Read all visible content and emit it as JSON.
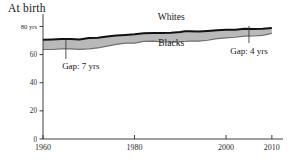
{
  "chart_data": {
    "type": "area",
    "title": "At birth",
    "xlabel": "",
    "ylabel": "",
    "ylim": [
      0,
      86
    ],
    "xlim": [
      1960,
      2012
    ],
    "grid": false,
    "legend_position": "inline-annotations",
    "y_ticks": [
      0,
      20,
      40,
      60,
      80
    ],
    "y_tick_labels": [
      "0",
      "20",
      "40",
      "60",
      "80 yrs"
    ],
    "x_ticks": [
      1960,
      1980,
      2000,
      2010
    ],
    "x_tick_labels": [
      "1960",
      "1980",
      "2000",
      "2010"
    ],
    "series": [
      {
        "name": "Whites",
        "color": "#111111",
        "x": [
          1960,
          1962,
          1964,
          1966,
          1968,
          1970,
          1972,
          1974,
          1976,
          1978,
          1980,
          1982,
          1984,
          1986,
          1988,
          1990,
          1991,
          1992,
          1994,
          1996,
          1998,
          2000,
          2002,
          2004,
          2006,
          2008,
          2010
        ],
        "values": [
          70.6,
          70.8,
          71.0,
          71.0,
          70.8,
          71.7,
          72.0,
          72.8,
          73.5,
          74.0,
          74.4,
          75.1,
          75.3,
          75.4,
          75.6,
          76.1,
          76.6,
          76.5,
          76.4,
          76.8,
          77.3,
          77.6,
          77.7,
          78.3,
          78.2,
          78.4,
          78.9
        ]
      },
      {
        "name": "Blacks",
        "color": "#6f6f6f",
        "x": [
          1960,
          1962,
          1964,
          1966,
          1968,
          1970,
          1972,
          1974,
          1976,
          1978,
          1980,
          1982,
          1984,
          1986,
          1988,
          1990,
          1991,
          1992,
          1994,
          1996,
          1998,
          2000,
          2002,
          2004,
          2006,
          2008,
          2010
        ],
        "values": [
          63.6,
          63.6,
          64.1,
          64.0,
          63.7,
          64.1,
          64.7,
          66.0,
          67.2,
          68.1,
          68.1,
          69.4,
          69.5,
          69.1,
          68.9,
          69.1,
          69.3,
          69.6,
          69.5,
          70.2,
          71.3,
          71.9,
          72.3,
          73.1,
          73.2,
          73.7,
          75.1
        ]
      }
    ],
    "annotations": [
      {
        "id": "gap-1965",
        "text": "Gap: 7 yrs",
        "year": 1965,
        "value_top": 71.0,
        "value_bottom": 64.0,
        "gap_years": 7
      },
      {
        "id": "gap-2005",
        "text": "Gap: 4 yrs",
        "year": 2005,
        "value_top": 78.2,
        "value_bottom": 73.2,
        "gap_years": 4
      }
    ],
    "series_labels": [
      {
        "text": "Whites",
        "year": 1988,
        "value": 84.5
      },
      {
        "text": "Blacks",
        "year": 1988,
        "value": 66.0
      }
    ],
    "colors": {
      "whites_line": "#111111",
      "blacks_band_fill": "#b9b9b9",
      "blacks_line": "#6f6f6f",
      "axis": "#2b2b2b",
      "text": "#161616",
      "background": "#ffffff"
    }
  }
}
